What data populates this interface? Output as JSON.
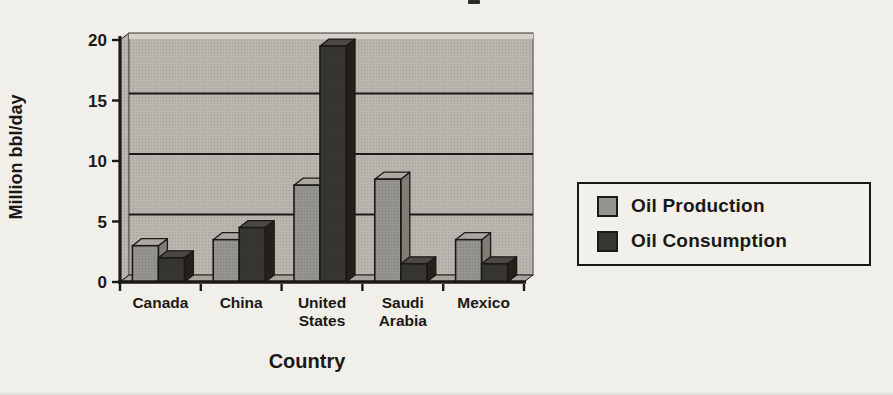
{
  "chart_data": {
    "type": "bar",
    "style": "3d-clustered-bar",
    "categories": [
      "Canada",
      "China",
      "United States",
      "Saudi Arabia",
      "Mexico"
    ],
    "series": [
      {
        "name": "Oil Production",
        "color": "#96948e",
        "values": [
          3,
          3.5,
          8,
          8.5,
          3.5
        ]
      },
      {
        "name": "Oil Consumption",
        "color": "#383632",
        "values": [
          2,
          4.5,
          19.5,
          1.5,
          1.5
        ]
      }
    ],
    "xlabel": "Country",
    "ylabel": "Million bbl/day",
    "ylim": [
      0,
      20
    ],
    "yticks": [
      0,
      5,
      10,
      15,
      20
    ],
    "grid": true,
    "legend_position": "right"
  },
  "colors": {
    "page_background": "#f1efe9",
    "wall": "#b8b6af",
    "floor": "#a9a7a0",
    "axis_line": "#1b1917",
    "text": "#1b1917"
  }
}
